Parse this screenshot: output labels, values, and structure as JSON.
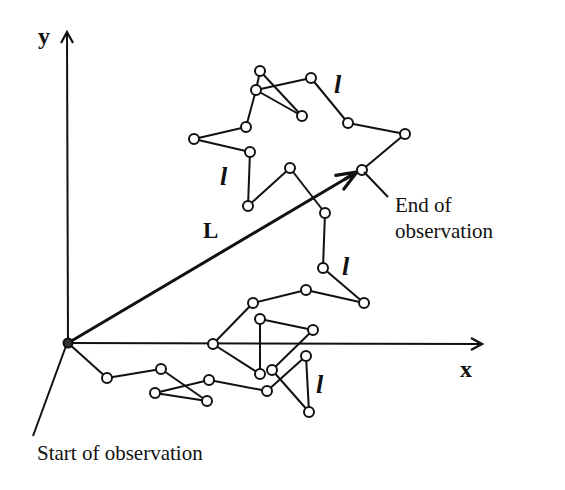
{
  "diagram": {
    "stroke_color": "#111111",
    "background": "#ffffff",
    "axes": {
      "origin": [
        68,
        343
      ],
      "x_end": [
        482,
        344
      ],
      "y_end": [
        67,
        32
      ],
      "x_label": "x",
      "y_label": "y"
    },
    "labels": {
      "displacement": "L",
      "segment": "l",
      "start": "Start of observation",
      "end_line1": "End of",
      "end_line2": "observation"
    },
    "path_nodes": [
      {
        "id": "origin",
        "x": 68,
        "y": 343,
        "filled": true
      },
      {
        "id": "V",
        "x": 107,
        "y": 378
      },
      {
        "id": "W",
        "x": 161,
        "y": 369
      },
      {
        "id": "Z",
        "x": 207,
        "y": 401
      },
      {
        "id": "X",
        "x": 155,
        "y": 393
      },
      {
        "id": "Y",
        "x": 209,
        "y": 380
      },
      {
        "id": "AD",
        "x": 267,
        "y": 391
      },
      {
        "id": "AC",
        "x": 306,
        "y": 356
      },
      {
        "id": "AE",
        "x": 309,
        "y": 412
      },
      {
        "id": "AB",
        "x": 272,
        "y": 370
      },
      {
        "id": "U",
        "x": 313,
        "y": 330
      },
      {
        "id": "T",
        "x": 260,
        "y": 319
      },
      {
        "id": "AA",
        "x": 260,
        "y": 374
      },
      {
        "id": "S",
        "x": 213,
        "y": 344
      },
      {
        "id": "R",
        "x": 253,
        "y": 303
      },
      {
        "id": "Q",
        "x": 306,
        "y": 290
      },
      {
        "id": "P",
        "x": 364,
        "y": 303
      },
      {
        "id": "O",
        "x": 323,
        "y": 268
      },
      {
        "id": "N",
        "x": 325,
        "y": 213
      },
      {
        "id": "K",
        "x": 290,
        "y": 168
      },
      {
        "id": "J",
        "x": 248,
        "y": 206
      },
      {
        "id": "I",
        "x": 250,
        "y": 152
      },
      {
        "id": "H",
        "x": 194,
        "y": 139
      },
      {
        "id": "G",
        "x": 246,
        "y": 127
      },
      {
        "id": "B",
        "x": 256,
        "y": 90
      },
      {
        "id": "A",
        "x": 260,
        "y": 71
      },
      {
        "id": "D",
        "x": 302,
        "y": 116
      },
      {
        "id": "B2",
        "x": 256,
        "y": 90
      },
      {
        "id": "C",
        "x": 311,
        "y": 78
      },
      {
        "id": "E",
        "x": 348,
        "y": 123
      },
      {
        "id": "F",
        "x": 405,
        "y": 134
      },
      {
        "id": "M",
        "x": 362,
        "y": 170
      }
    ],
    "displacement_arrow": {
      "from": [
        68,
        343
      ],
      "to": [
        357,
        172
      ]
    },
    "segment_label_positions": [
      [
        334,
        93
      ],
      [
        220,
        185
      ],
      [
        342,
        275
      ],
      [
        316,
        393
      ]
    ],
    "start_pointer": {
      "from": [
        66,
        346
      ],
      "to": [
        33,
        436
      ]
    },
    "end_pointer": {
      "from": [
        364,
        172
      ],
      "to": [
        388,
        197
      ]
    }
  }
}
